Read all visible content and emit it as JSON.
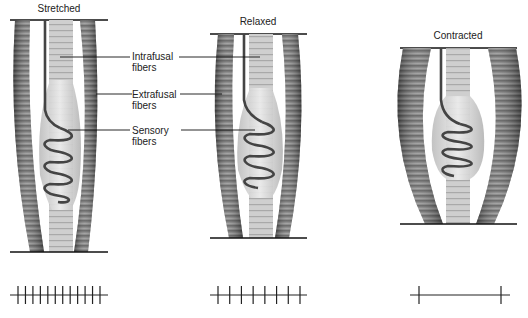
{
  "diagram": {
    "colors": {
      "line": "#111111",
      "extrafusal_dark": "#5e5e5e",
      "extrafusal_light": "#9a9a9a",
      "spindle_fill": "#dcdcdc",
      "intrafusal": "#c4c4c4",
      "sensory_fiber": "#4a4a4a"
    },
    "panels": [
      {
        "id": "stretched",
        "title": "Stretched",
        "firing_ticks": 12
      },
      {
        "id": "relaxed",
        "title": "Relaxed",
        "firing_ticks": 8
      },
      {
        "id": "contracted",
        "title": "Contracted",
        "firing_ticks": 2
      }
    ],
    "labels": {
      "intrafusal": [
        "Intrafusal",
        "fibers"
      ],
      "extrafusal": [
        "Extrafusal",
        "fibers"
      ],
      "sensory": [
        "Sensory",
        "fibers"
      ]
    }
  }
}
